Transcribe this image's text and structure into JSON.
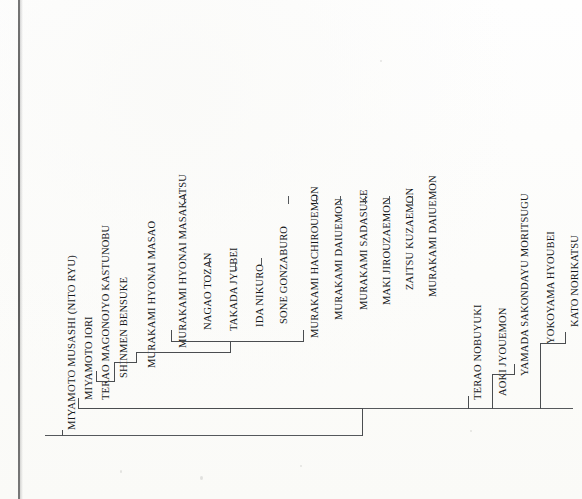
{
  "chart": {
    "type": "genealogy-tree",
    "orientation": "vertical-text-left-to-right",
    "line_color": "#4a4d50",
    "text_color": "#16181a",
    "background_color": "#fdfdfc"
  },
  "names": {
    "n01": "MIYAMOTO MUSASHI (NITO RYU)",
    "n02": "MIYAMOTO IORI",
    "n03": "TERAO MAGONOJYO KASTUNOBU",
    "n04": "SHINMEN BENSUKE",
    "n05": "MURAKAMI HYONAI MASAO",
    "n06": "MURAKAMI HYONAI MASAKATSU",
    "n07": "NAGAO TOZAN",
    "n08": "TAKADA JYUBEI",
    "n09": "IDA NIKURO",
    "n10": "SONE GONZABURO",
    "n11": "MURAKAMI HACHIROUEMON",
    "n12": "MURAKAMI DAIUEMON",
    "n13": "MURAKAMI SADASUKE",
    "n14": "MAKI JIROUZAEMON",
    "n15": "ZAITSU KUZAEMON",
    "n16": "MURAKAMI DAIUEMON",
    "n17": "TERAO NOBUYUKI",
    "n18": "AOKI JYOUEMON",
    "n19": "YAMADA SAKONDAYU MORITSUGU",
    "n20": "YOKOYAMA HYOUBEI",
    "n21": "KATO NORIKATSU"
  },
  "lineage_order": [
    "MIYAMOTO MUSASHI (NITO RYU)",
    "MIYAMOTO IORI",
    "TERAO MAGONOJYO KASTUNOBU",
    "SHINMEN BENSUKE",
    "MURAKAMI HYONAI MASAO",
    "MURAKAMI HYONAI MASAKATSU",
    "NAGAO TOZAN",
    "TAKADA JYUBEI",
    "IDA NIKURO",
    "SONE GONZABURO",
    "MURAKAMI HACHIROUEMON",
    "MURAKAMI DAIUEMON",
    "MURAKAMI SADASUKE",
    "MAKI JIROUZAEMON",
    "ZAITSU KUZAEMON",
    "MURAKAMI DAIUEMON",
    "TERAO NOBUYUKI",
    "AOKI JYOUEMON",
    "YAMADA SAKONDAYU MORITSUGU",
    "YOKOYAMA HYOUBEI",
    "KATO NORIKATSU"
  ]
}
